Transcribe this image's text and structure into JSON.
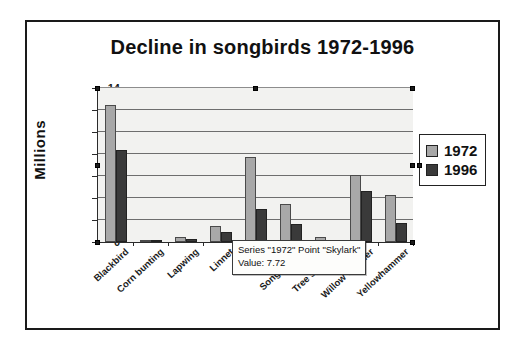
{
  "chart_data": {
    "type": "bar",
    "title": "Decline in songbirds 1972-1996",
    "xlabel": "",
    "ylabel": "Millions",
    "ylim": [
      0,
      14
    ],
    "ytick_step": 2,
    "yticks": [
      0,
      2,
      4,
      6,
      8,
      10,
      12,
      14
    ],
    "grid": true,
    "legend_position": "right",
    "categories": [
      "Blackbird",
      "Corn bunting",
      "Lapwing",
      "Linnet",
      "Skylark",
      "Song thrush",
      "Tree sparrow",
      "Willow Warbler",
      "Yellowhammer"
    ],
    "series": [
      {
        "name": "1972",
        "color": "#a8a8a8",
        "values": [
          12.5,
          0.05,
          0.5,
          1.5,
          7.72,
          3.5,
          0.5,
          6.1,
          4.3
        ]
      },
      {
        "name": "1996",
        "color": "#3a3a3a",
        "values": [
          8.4,
          0.02,
          0.25,
          0.9,
          3.0,
          1.6,
          0.04,
          4.6,
          1.75
        ]
      }
    ]
  },
  "tooltip": {
    "line1": "Series \"1972\" Point \"Skylark\"",
    "line2": "Value: 7.72"
  },
  "legend": {
    "items": [
      {
        "label": "1972"
      },
      {
        "label": "1996"
      }
    ]
  },
  "colors": {
    "series_1972": "#a8a8a8",
    "series_1996": "#3a3a3a",
    "plot_background": "#f2f2f0",
    "frame": "#1a1a1a",
    "gridline": "#6e6e6e"
  }
}
